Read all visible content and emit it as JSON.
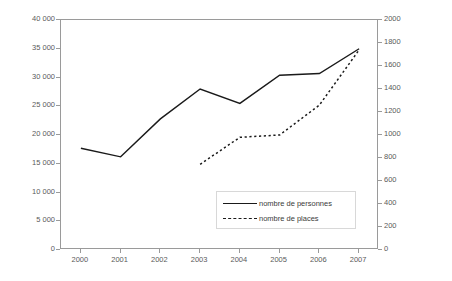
{
  "chart_data": {
    "type": "line",
    "title": "",
    "xlabel": "",
    "ylabel": "",
    "grid": false,
    "legend_position": "inside-bottom-center",
    "categories": [
      "2000",
      "2001",
      "2002",
      "2003",
      "2004",
      "2005",
      "2006",
      "2007"
    ],
    "x_tick_labels": [
      "2000",
      "2001",
      "2002",
      "2003",
      "2004",
      "2005",
      "2006",
      "2007"
    ],
    "left_axis": {
      "label": "",
      "ylim": [
        0,
        40000
      ],
      "tick_step": 5000,
      "tick_labels": [
        "0",
        "5 000",
        "10 000",
        "15 000",
        "20 000",
        "25 000",
        "30 000",
        "35 000",
        "40 000"
      ],
      "tick_values": [
        0,
        5000,
        10000,
        15000,
        20000,
        25000,
        30000,
        35000,
        40000
      ]
    },
    "right_axis": {
      "label": "",
      "ylim": [
        0,
        2000
      ],
      "tick_step": 200,
      "tick_labels": [
        "0",
        "200",
        "400",
        "600",
        "800",
        "1000",
        "1200",
        "1400",
        "1600",
        "1800",
        "2000"
      ],
      "tick_values": [
        0,
        200,
        400,
        600,
        800,
        1000,
        1200,
        1400,
        1600,
        1800,
        2000
      ]
    },
    "series": [
      {
        "name": "nombre de personnes",
        "axis": "left",
        "style": "solid",
        "color": "#1a1a1a",
        "x": [
          "2000",
          "2001",
          "2002",
          "2003",
          "2004",
          "2005",
          "2006",
          "2007"
        ],
        "values": [
          17700,
          16200,
          22800,
          28000,
          25500,
          30400,
          30700,
          35000
        ]
      },
      {
        "name": "nombre de places",
        "axis": "right",
        "style": "dashed",
        "color": "#1a1a1a",
        "x": [
          "2003",
          "2004",
          "2005",
          "2006",
          "2007"
        ],
        "values": [
          745,
          980,
          1000,
          1260,
          1740
        ]
      }
    ],
    "legend": [
      {
        "label": "nombre de personnes",
        "style": "solid"
      },
      {
        "label": "nombre de places",
        "style": "dashed"
      }
    ]
  }
}
